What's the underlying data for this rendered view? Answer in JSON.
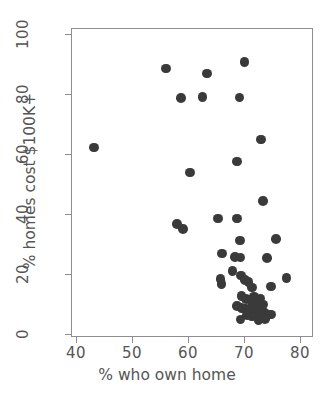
{
  "chart_data": {
    "type": "scatter",
    "title": "",
    "xlabel": "% who own home",
    "ylabel": "% homes cost $100K+",
    "xlim": [
      38,
      82
    ],
    "ylim": [
      -2,
      103
    ],
    "xticks": [
      40,
      50,
      60,
      70,
      80
    ],
    "yticks": [
      0,
      20,
      40,
      60,
      80,
      100
    ],
    "grid": false,
    "legend": null,
    "marker": {
      "shape": "circle",
      "color": "#3a3a3a",
      "size_px": 9.6
    },
    "points": [
      {
        "x": 43.0,
        "y": 62.5
      },
      {
        "x": 55.9,
        "y": 88.8
      },
      {
        "x": 58.6,
        "y": 79.0
      },
      {
        "x": 62.4,
        "y": 79.4
      },
      {
        "x": 63.2,
        "y": 87.2
      },
      {
        "x": 69.0,
        "y": 79.2
      },
      {
        "x": 69.9,
        "y": 91.0
      },
      {
        "x": 72.9,
        "y": 65.2
      },
      {
        "x": 68.6,
        "y": 57.8
      },
      {
        "x": 60.2,
        "y": 54.2
      },
      {
        "x": 73.2,
        "y": 44.6
      },
      {
        "x": 57.9,
        "y": 37.0
      },
      {
        "x": 58.9,
        "y": 35.4
      },
      {
        "x": 65.2,
        "y": 38.8
      },
      {
        "x": 68.6,
        "y": 38.8
      },
      {
        "x": 69.1,
        "y": 31.5
      },
      {
        "x": 75.5,
        "y": 32.0
      },
      {
        "x": 65.9,
        "y": 27.2
      },
      {
        "x": 68.2,
        "y": 26.0
      },
      {
        "x": 69.2,
        "y": 25.8
      },
      {
        "x": 73.9,
        "y": 25.6
      },
      {
        "x": 67.8,
        "y": 21.4
      },
      {
        "x": 69.3,
        "y": 19.8
      },
      {
        "x": 65.6,
        "y": 18.6
      },
      {
        "x": 65.8,
        "y": 17.0
      },
      {
        "x": 70.0,
        "y": 18.4
      },
      {
        "x": 70.6,
        "y": 17.6
      },
      {
        "x": 71.2,
        "y": 15.8
      },
      {
        "x": 77.4,
        "y": 19.0
      },
      {
        "x": 74.6,
        "y": 16.2
      },
      {
        "x": 69.4,
        "y": 13.0
      },
      {
        "x": 70.2,
        "y": 12.0
      },
      {
        "x": 70.9,
        "y": 11.8
      },
      {
        "x": 71.6,
        "y": 12.8
      },
      {
        "x": 72.2,
        "y": 11.4
      },
      {
        "x": 72.8,
        "y": 12.2
      },
      {
        "x": 71.4,
        "y": 10.4
      },
      {
        "x": 72.0,
        "y": 9.6
      },
      {
        "x": 72.6,
        "y": 9.8
      },
      {
        "x": 73.3,
        "y": 10.2
      },
      {
        "x": 68.6,
        "y": 9.6
      },
      {
        "x": 69.4,
        "y": 9.0
      },
      {
        "x": 70.2,
        "y": 8.6
      },
      {
        "x": 71.0,
        "y": 8.2
      },
      {
        "x": 71.8,
        "y": 8.0
      },
      {
        "x": 72.5,
        "y": 8.4
      },
      {
        "x": 73.2,
        "y": 7.8
      },
      {
        "x": 70.4,
        "y": 6.6
      },
      {
        "x": 71.2,
        "y": 6.2
      },
      {
        "x": 72.0,
        "y": 6.4
      },
      {
        "x": 73.0,
        "y": 6.8
      },
      {
        "x": 73.8,
        "y": 7.0
      },
      {
        "x": 74.6,
        "y": 6.8
      },
      {
        "x": 69.2,
        "y": 5.2
      },
      {
        "x": 72.4,
        "y": 5.0
      },
      {
        "x": 73.6,
        "y": 5.4
      }
    ]
  }
}
